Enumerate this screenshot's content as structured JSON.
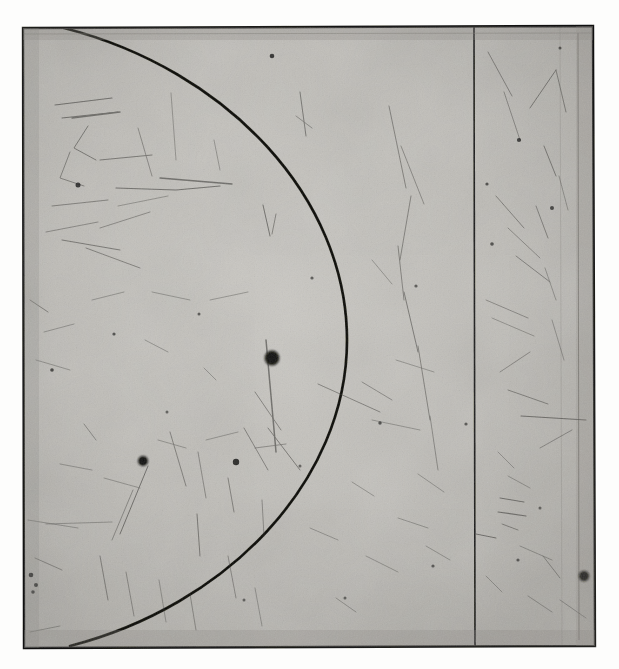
{
  "image": {
    "kind": "scanned-photographic-plate",
    "title": "Photographic plate scan with circular arc",
    "width": 619,
    "height": 669,
    "background_color": "#fdfdfc",
    "plate_fill_color": "#b9b7b2",
    "plate_fill_color_light": "#cfcdc8",
    "ink_color": "#1a1a1a",
    "border_color": "#232320",
    "faint_line_color": "#6b6965",
    "scratch_color": "#3d3c39",
    "blob_color": "#141413"
  },
  "plate": {
    "label": "plate-rectangle",
    "left": 23,
    "top": 27,
    "right": 594,
    "bottom": 647,
    "border_width": 2.2,
    "corners": [
      {
        "name": "top-left",
        "x": 23,
        "y": 28
      },
      {
        "name": "top-right",
        "x": 593,
        "y": 26
      },
      {
        "name": "bottom-right",
        "x": 595,
        "y": 646
      },
      {
        "name": "bottom-left",
        "x": 24,
        "y": 648
      }
    ]
  },
  "marks": {
    "arc": {
      "label": "circular-arc",
      "description": "Large circular arc bulging rightward, meeting the top border near x=64 and the bottom border near x=70, rightmost extent near x=347",
      "start": {
        "x": 64,
        "y": 28
      },
      "end": {
        "x": 70,
        "y": 646
      },
      "apex": {
        "x": 347,
        "y": 340
      },
      "stroke_width": 2.6
    },
    "vertical_line_main": {
      "label": "vertical-rule-right",
      "x": 474,
      "y_top": 27,
      "y_bottom": 647,
      "stroke_width": 1.6
    },
    "vertical_line_faint": {
      "label": "vertical-rule-faint-right",
      "x": 578,
      "y_top": 33,
      "y_bottom": 640,
      "stroke_width": 0.9
    },
    "inner_top_rule": {
      "label": "inner-top-rule",
      "x_left": 23,
      "x_right": 593,
      "y": 34,
      "stroke_width": 0.7
    },
    "blobs": [
      {
        "name": "blob-center-left",
        "x": 272,
        "y": 358,
        "r": 7.5
      },
      {
        "name": "blob-lower-left",
        "x": 143,
        "y": 461,
        "r": 5.0
      },
      {
        "name": "blob-right-lower",
        "x": 584,
        "y": 576,
        "r": 5.5
      },
      {
        "name": "blob-mid",
        "x": 236,
        "y": 462,
        "r": 3.4
      },
      {
        "name": "blob-small-upper",
        "x": 272,
        "y": 56,
        "r": 2.4
      },
      {
        "name": "blob-small-left",
        "x": 78,
        "y": 185,
        "r": 2.6
      },
      {
        "name": "blob-small-right",
        "x": 519,
        "y": 140,
        "r": 2.2
      },
      {
        "name": "blob-small-low",
        "x": 31,
        "y": 575,
        "r": 2.4
      }
    ],
    "long_scratch": {
      "label": "vertical-scratch-from-blob",
      "x1": 272,
      "y1": 362,
      "x2": 277,
      "y2": 452
    }
  },
  "texture": {
    "grain_description": "fine silver-halide grain, medium gray",
    "scratch_count_visible": 120,
    "vignette": "edges slightly darker than centre"
  }
}
